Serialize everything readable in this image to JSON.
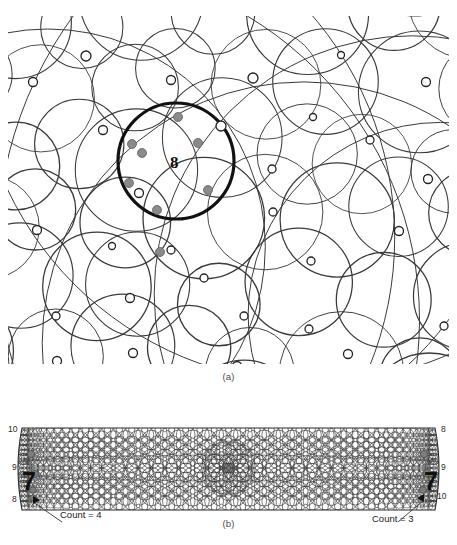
{
  "figure": {
    "panel_a": {
      "caption": "(a)",
      "highlight_label": "8",
      "highlight_circle": {
        "cx": 168,
        "cy": 145,
        "r": 58,
        "stroke": "#111111",
        "stroke_width": 3.2
      },
      "open_marker_color": "#ffffff",
      "open_marker_stroke": "#222222",
      "filled_marker_color": "#8a8a8a",
      "line_color": "#3a3a3a",
      "open_markers": [
        {
          "x": 78,
          "y": 40,
          "r": 5
        },
        {
          "x": 25,
          "y": 66,
          "r": 4.5
        },
        {
          "x": 163,
          "y": 64,
          "r": 4.5
        },
        {
          "x": 245,
          "y": 62,
          "r": 5
        },
        {
          "x": 333,
          "y": 39,
          "r": 3.5
        },
        {
          "x": 418,
          "y": 66,
          "r": 4.5
        },
        {
          "x": 95,
          "y": 114,
          "r": 4.5
        },
        {
          "x": 213,
          "y": 110,
          "r": 5
        },
        {
          "x": 305,
          "y": 101,
          "r": 3.5
        },
        {
          "x": 131,
          "y": 177,
          "r": 4.5
        },
        {
          "x": 264,
          "y": 153,
          "r": 4
        },
        {
          "x": 362,
          "y": 124,
          "r": 4
        },
        {
          "x": 29,
          "y": 214,
          "r": 4.5
        },
        {
          "x": 104,
          "y": 230,
          "r": 3.5
        },
        {
          "x": 163,
          "y": 234,
          "r": 4
        },
        {
          "x": 265,
          "y": 196,
          "r": 4
        },
        {
          "x": 420,
          "y": 163,
          "r": 4.5
        },
        {
          "x": 196,
          "y": 262,
          "r": 4
        },
        {
          "x": 303,
          "y": 245,
          "r": 4
        },
        {
          "x": 391,
          "y": 215,
          "r": 4.5
        },
        {
          "x": 122,
          "y": 282,
          "r": 4.5
        },
        {
          "x": 48,
          "y": 300,
          "r": 4
        },
        {
          "x": 236,
          "y": 300,
          "r": 4
        },
        {
          "x": 301,
          "y": 313,
          "r": 4
        },
        {
          "x": 49,
          "y": 345,
          "r": 4.5
        },
        {
          "x": 125,
          "y": 337,
          "r": 4.5
        },
        {
          "x": 229,
          "y": 350,
          "r": 4.5
        },
        {
          "x": 340,
          "y": 338,
          "r": 4.5
        },
        {
          "x": 436,
          "y": 310,
          "r": 4
        }
      ],
      "filled_markers": [
        {
          "x": 170,
          "y": 101,
          "r": 4.5
        },
        {
          "x": 124,
          "y": 128,
          "r": 4.5
        },
        {
          "x": 134,
          "y": 137,
          "r": 4.5
        },
        {
          "x": 190,
          "y": 127,
          "r": 4.5
        },
        {
          "x": 121,
          "y": 167,
          "r": 4.5
        },
        {
          "x": 200,
          "y": 174,
          "r": 4.5
        },
        {
          "x": 149,
          "y": 194,
          "r": 4.5
        },
        {
          "x": 152,
          "y": 236,
          "r": 4.5
        }
      ]
    },
    "panel_b": {
      "caption": "(b)",
      "left_axis_labels": [
        "10",
        "9",
        "8"
      ],
      "right_axis_labels": [
        "8",
        "9",
        "10"
      ],
      "left_annotation": "Count = 4",
      "right_annotation": "Count = 3",
      "left_marker_glyph": "7",
      "right_marker_glyph": "7",
      "line_color": "#3a3a3a",
      "filled_marker_color": "#7d7d7d",
      "left_filled_markers": [
        {
          "x": 31,
          "y": 44,
          "r": 3.6
        },
        {
          "x": 35,
          "y": 64,
          "r": 3.6
        },
        {
          "x": 33,
          "y": 80,
          "r": 3.2
        },
        {
          "x": 33,
          "y": 88,
          "r": 3.2
        }
      ],
      "right_filled_markers": [
        {
          "x": 424,
          "y": 44,
          "r": 3.6
        },
        {
          "x": 427,
          "y": 63,
          "r": 3.6
        },
        {
          "x": 423,
          "y": 80,
          "r": 3.4
        }
      ]
    }
  }
}
